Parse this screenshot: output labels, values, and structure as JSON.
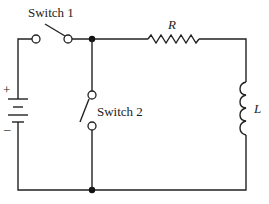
{
  "diagram": {
    "type": "circuit schematic",
    "components": {
      "battery": {
        "label_plus": "+",
        "label_minus": "–"
      },
      "switch1": {
        "label": "Switch 1",
        "state": "open"
      },
      "switch2": {
        "label": "Switch 2",
        "state": "open"
      },
      "resistor": {
        "label": "R"
      },
      "inductor": {
        "label": "L"
      }
    },
    "colors": {
      "line": "#222222",
      "background": "#ffffff"
    }
  }
}
